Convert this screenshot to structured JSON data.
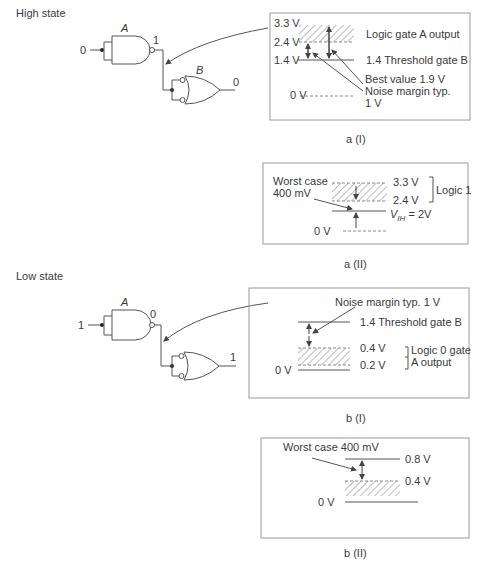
{
  "sections": {
    "high_state": {
      "title": "High state",
      "circuit": {
        "gate_a_label": "A",
        "gate_b_label": "B",
        "input_a": "0",
        "output_a": "1",
        "output_b": "0"
      },
      "panel_a1": {
        "caption": "a (I)",
        "levels": [
          "3.3 V",
          "2.4 V",
          "1.4 V",
          "0 V"
        ],
        "annotations": {
          "gate_a_output": "Logic gate A output",
          "threshold": "1.4 Threshold gate B",
          "best_value": "Best value 1.9 V",
          "noise_margin_1": "Noise margin typ.",
          "noise_margin_2": "1 V"
        }
      },
      "panel_a2": {
        "caption": "a (II)",
        "worst_case_1": "Worst case",
        "worst_case_2": "400 mV",
        "level_top": "3.3 V",
        "level_mid": "2.4 V",
        "logic_label": "Logic 1",
        "vih_v": "V",
        "vih_sub": "IH",
        "vih_val": " = 2V",
        "zero": "0 V"
      }
    },
    "low_state": {
      "title": "Low state",
      "circuit": {
        "gate_a_label": "A",
        "input_a": "1",
        "output_a": "0",
        "output_b": "1"
      },
      "panel_b1": {
        "caption": "b (I)",
        "noise_margin": "Noise margin typ. 1 V",
        "threshold": "1.4  Threshold gate B",
        "level_04": "0.4  V",
        "level_02": "0.2  V",
        "logic_label_1": "Logic 0 gate",
        "logic_label_2": "A  output",
        "zero": "0 V"
      },
      "panel_b2": {
        "caption": "b (II)",
        "worst_case": "Worst case 400 mV",
        "level_08": "0.8 V",
        "level_04": "0.4 V",
        "zero": "0 V"
      }
    }
  },
  "colors": {
    "line": "#555555",
    "box": "#9a9a9a",
    "hatch": "#777777"
  }
}
